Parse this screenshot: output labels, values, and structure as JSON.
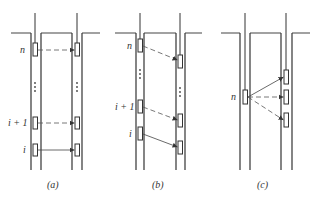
{
  "panels": [
    {
      "caption": "(a)",
      "left_labels": {
        "n": "n",
        "i_plus_1": "i + 1",
        "i": "i"
      },
      "description": "Horizontal correlation: each layer n, i+1, i in the left well links horizontally to the same layer in the right well"
    },
    {
      "caption": "(b)",
      "left_labels": {
        "n": "n",
        "i_plus_1": "i + 1",
        "i": "i"
      },
      "description": "Dipping correlation: each layer in the left well links to a deeper position in the right well"
    },
    {
      "caption": "(c)",
      "left_labels": {
        "n": "n"
      },
      "description": "Single layer n in the left well fans out to three candidate layers in the right well"
    }
  ],
  "colors": {
    "line": "#333333",
    "background": "#ffffff"
  }
}
